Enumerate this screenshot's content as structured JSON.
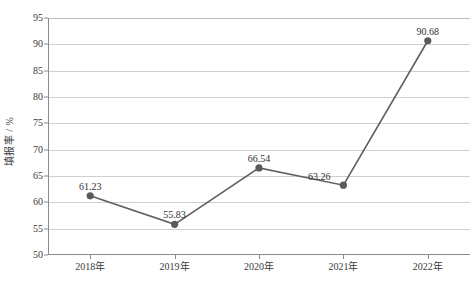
{
  "chart_data": {
    "type": "line",
    "title": "",
    "xlabel": "",
    "ylabel": "填报率 / %",
    "categories": [
      "2018年",
      "2019年",
      "2020年",
      "2021年",
      "2022年"
    ],
    "values": [
      61.23,
      55.83,
      66.54,
      63.26,
      90.68
    ],
    "point_labels": [
      "61.23",
      "55.83",
      "66.54",
      "63.26",
      "90.68"
    ],
    "ylim": [
      50,
      95
    ],
    "ytick_step": 5,
    "ytick_labels": [
      "95",
      "90",
      "85",
      "80",
      "75",
      "70",
      "65",
      "60",
      "55",
      "50"
    ],
    "grid": "horizontal",
    "legend": "none",
    "series": [
      {
        "name": "填报率",
        "values": [
          61.23,
          55.83,
          66.54,
          63.26,
          90.68
        ],
        "line_color": "#5f5f5f",
        "marker_color": "#5a5a5a",
        "marker": "circle"
      }
    ],
    "colors": {
      "line": "#5f5f5f",
      "marker": "#5a5a5a",
      "grid": "#d0d0d0",
      "axis": "#8a8a8a",
      "text": "#3b3b3b",
      "background": "#ffffff"
    }
  }
}
